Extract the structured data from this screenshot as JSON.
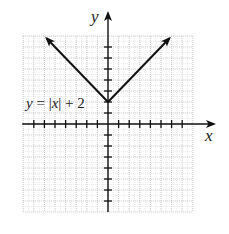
{
  "chart_data": {
    "type": "line",
    "title": "",
    "function_label": "y = |x| + 2",
    "label_parts": {
      "y": "y",
      "eq": " = |",
      "x": "x",
      "rest": "| + 2"
    },
    "xlabel": "x",
    "ylabel": "y",
    "xlim": [
      -8,
      8
    ],
    "ylim": [
      -8,
      8
    ],
    "grid": true,
    "ticks": {
      "x": [
        -7,
        -6,
        -5,
        -4,
        -3,
        -2,
        -1,
        1,
        2,
        3,
        4,
        5,
        6,
        7
      ],
      "y": [
        -7,
        -6,
        -5,
        -4,
        -3,
        -2,
        -1,
        1,
        2,
        3,
        4,
        5,
        6,
        7
      ]
    },
    "series": [
      {
        "name": "y = |x| + 2",
        "x": [
          -5.8,
          0,
          5.8
        ],
        "y": [
          7.8,
          2,
          7.8
        ],
        "arrows": "both-ends",
        "vertex": [
          0,
          2
        ]
      }
    ],
    "colors": {
      "curve": "#111111",
      "axes": "#111111",
      "grid": "#bdbdbd"
    }
  }
}
